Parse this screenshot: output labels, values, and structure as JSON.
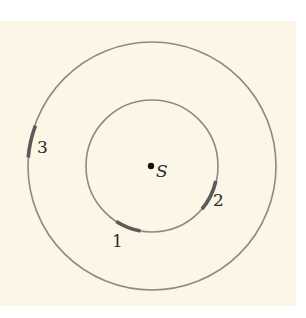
{
  "diagram": {
    "background_color": "#fcf6e6",
    "circle_color": "#8a8a88",
    "arc_color": "#5a5a5a",
    "center": {
      "label": "S",
      "x": 152,
      "y": 166
    },
    "circles": [
      {
        "name": "inner-circle",
        "r": 66
      },
      {
        "name": "outer-circle",
        "r": 124
      }
    ],
    "arcs": [
      {
        "label": "1",
        "circle": "inner",
        "from_deg": 123,
        "to_deg": 100
      },
      {
        "label": "2",
        "circle": "inner",
        "from_deg": 15,
        "to_deg": 40
      },
      {
        "label": "3",
        "circle": "outer",
        "from_deg": 161,
        "to_deg": 177
      }
    ],
    "labels": {
      "one": "1",
      "two": "2",
      "three": "3",
      "source": "S"
    }
  }
}
